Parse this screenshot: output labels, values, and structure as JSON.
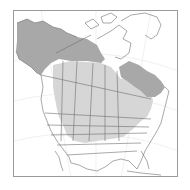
{
  "map": {
    "type": "range-map",
    "region": "North America",
    "colors": {
      "background": "#ffffff",
      "frame": "#9a9a9a",
      "land": "#ffffff",
      "borders": "#6e6e6e",
      "graticule": "#e6e6e6",
      "range_dark": "#a8a8a8",
      "range_light": "#d6d6d6"
    },
    "legend": [
      {
        "key": "range_dark",
        "label": "Breeding"
      },
      {
        "key": "range_light",
        "label": "Year-round"
      }
    ]
  }
}
